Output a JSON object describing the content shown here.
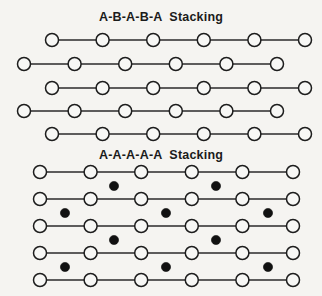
{
  "figure": {
    "width": 322,
    "height": 296,
    "background_color": "#f5f4f1",
    "atom_outline_color": "#1d1d1d",
    "atom_open_fill": "#f7f7f5",
    "atom_filled_color": "#111111",
    "bond_color": "#2a2a2a"
  },
  "panels": [
    {
      "id": "ab-stacking",
      "title": "A-B-A-B-A  Stacking",
      "open_radius": 6.5,
      "rows": [
        {
          "y": 40,
          "start_x": 52,
          "spacing": 50.6,
          "count": 6
        },
        {
          "y": 64,
          "start_x": 24,
          "spacing": 50.6,
          "count": 6
        },
        {
          "y": 88,
          "start_x": 52,
          "spacing": 50.6,
          "count": 6
        },
        {
          "y": 111,
          "start_x": 24,
          "spacing": 50.6,
          "count": 6
        },
        {
          "y": 134,
          "start_x": 52,
          "spacing": 50.6,
          "count": 6
        }
      ],
      "interstitial_bands": []
    },
    {
      "id": "aa-stacking",
      "title": "A-A-A-A-A  Stacking",
      "open_radius": 6.5,
      "filled_radius": 4.6,
      "rows": [
        {
          "y": 24,
          "start_x": 40,
          "spacing": 50.6,
          "count": 6
        },
        {
          "y": 51,
          "start_x": 40,
          "spacing": 50.6,
          "count": 6
        },
        {
          "y": 78,
          "start_x": 40,
          "spacing": 50.6,
          "count": 6
        },
        {
          "y": 105,
          "start_x": 40,
          "spacing": 50.6,
          "count": 6
        },
        {
          "y": 132,
          "start_x": 40,
          "spacing": 50.6,
          "count": 6
        }
      ],
      "interstitial_bands": [
        {
          "y": 38,
          "x_positions": [
            114,
            216
          ]
        },
        {
          "y": 65,
          "x_positions": [
            65,
            166,
            268
          ]
        },
        {
          "y": 92,
          "x_positions": [
            114,
            216
          ]
        },
        {
          "y": 119,
          "x_positions": [
            65,
            166,
            268
          ]
        }
      ]
    }
  ]
}
